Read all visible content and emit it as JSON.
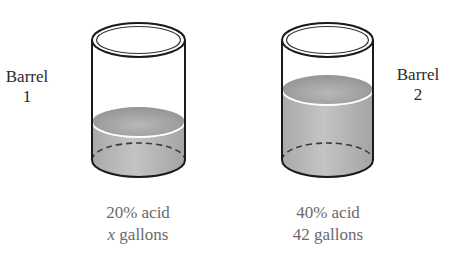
{
  "diagram": {
    "type": "mixture-problem-illustration",
    "barrels": [
      {
        "name_line1": "Barrel",
        "name_line2": "1",
        "concentration": "20% acid",
        "volume_variable": "x",
        "volume_unit": "gallons",
        "fill_level": "low"
      },
      {
        "name_line1": "Barrel",
        "name_line2": "2",
        "concentration": "40% acid",
        "volume_value": "42",
        "volume_unit": "gallons",
        "fill_level": "high"
      }
    ],
    "colors": {
      "outline": "#1a1a1a",
      "liquid_light": "#c8c8c8",
      "liquid_dark": "#9a9a9a",
      "liquid_surface": "#a8a8a8",
      "caption_text": "#6a6a6a",
      "label_text": "#2a2a2a"
    }
  }
}
